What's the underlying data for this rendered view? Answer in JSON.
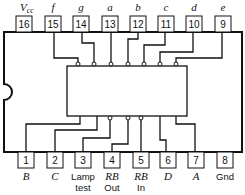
{
  "diagram": {
    "type": "ic-pinout",
    "top_pins": [
      {
        "number": "16",
        "label": "V",
        "sub": "cc"
      },
      {
        "number": "15",
        "label": "f"
      },
      {
        "number": "14",
        "label": "g"
      },
      {
        "number": "13",
        "label": "a"
      },
      {
        "number": "12",
        "label": "b"
      },
      {
        "number": "11",
        "label": "c"
      },
      {
        "number": "10",
        "label": "d"
      },
      {
        "number": "9",
        "label": "e"
      }
    ],
    "bottom_pins": [
      {
        "number": "1",
        "label": "B",
        "line2": ""
      },
      {
        "number": "2",
        "label": "C",
        "line2": ""
      },
      {
        "number": "3",
        "label": "Lamp",
        "line2": "test"
      },
      {
        "number": "4",
        "label": "RB",
        "line2": "Out"
      },
      {
        "number": "5",
        "label": "RB",
        "line2": "In"
      },
      {
        "number": "6",
        "label": "D",
        "line2": ""
      },
      {
        "number": "7",
        "label": "A",
        "line2": ""
      },
      {
        "number": "8",
        "label": "Gnd",
        "line2": ""
      }
    ]
  }
}
